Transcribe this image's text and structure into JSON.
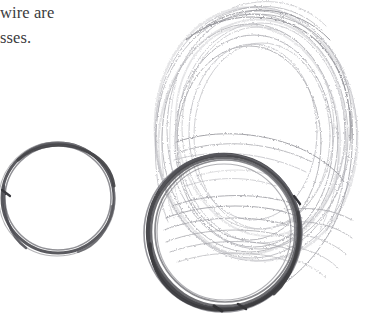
{
  "page": {
    "background_color": "#ffffff",
    "width": 373,
    "height": 314,
    "kind": "scanned-page-fragment"
  },
  "text_block": {
    "text_color": "#3b3b3d",
    "lines": [
      {
        "id": "line-1",
        "text": "wire are"
      },
      {
        "id": "line-2",
        "text": "sses."
      }
    ]
  },
  "artwork": {
    "caption_absent": true,
    "objects": [
      {
        "id": "small-wire-coil",
        "name": "small-wire-coil",
        "description": "small dark thin wire ring",
        "stroke_color": "#585858",
        "center_x": 58,
        "center_y": 198,
        "radius_x": 56,
        "radius_y": 55
      },
      {
        "id": "large-light-wire-coil",
        "name": "large-light-wire-coil",
        "description": "large loose bundle of many pale grey wire strands",
        "stroke_color": "#b9b9bd",
        "center_x": 255,
        "center_y": 133,
        "radius_x": 102,
        "radius_y": 128
      },
      {
        "id": "dark-wire-coil",
        "name": "dark-wire-coil",
        "description": "thick dark wire ring overlapping lower part of large coil",
        "stroke_color": "#4c4c50",
        "center_x": 224,
        "center_y": 232,
        "radius_x": 76,
        "radius_y": 77
      }
    ]
  }
}
